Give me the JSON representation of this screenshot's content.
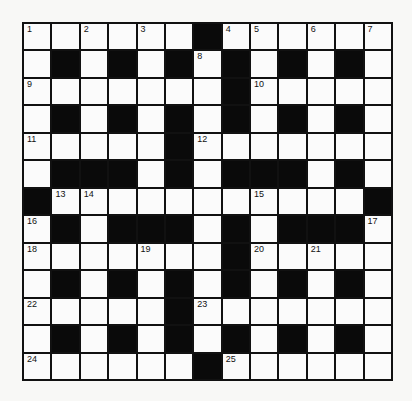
{
  "puzzle": {
    "type": "crossword",
    "size": {
      "rows": 13,
      "cols": 13
    },
    "colors": {
      "black": "#0a0a0a",
      "white": "#fbfbfb",
      "line": "#111111"
    },
    "grid": [
      [
        "1",
        ".",
        "2",
        ".",
        "3",
        ".",
        "#",
        "4",
        "5",
        ".",
        "6",
        ".",
        "7"
      ],
      [
        ".",
        "#",
        ".",
        "#",
        ".",
        "#",
        "8",
        "#",
        ".",
        "#",
        ".",
        "#",
        "."
      ],
      [
        "9",
        ".",
        ".",
        ".",
        ".",
        ".",
        ".",
        "#",
        "10",
        ".",
        ".",
        ".",
        "."
      ],
      [
        ".",
        "#",
        ".",
        "#",
        ".",
        "#",
        ".",
        "#",
        ".",
        "#",
        ".",
        "#",
        "."
      ],
      [
        "11",
        ".",
        ".",
        ".",
        ".",
        "#",
        "12",
        ".",
        ".",
        ".",
        ".",
        ".",
        "."
      ],
      [
        ".",
        "#",
        "#",
        "#",
        ".",
        "#",
        ".",
        "#",
        "#",
        "#",
        ".",
        "#",
        "."
      ],
      [
        "#",
        "13",
        "14",
        ".",
        ".",
        ".",
        ".",
        ".",
        "15",
        ".",
        ".",
        ".",
        "#"
      ],
      [
        "16",
        "#",
        ".",
        "#",
        "#",
        "#",
        ".",
        "#",
        ".",
        "#",
        "#",
        "#",
        "17"
      ],
      [
        "18",
        ".",
        ".",
        ".",
        "19",
        ".",
        ".",
        "#",
        "20",
        ".",
        "21",
        ".",
        "."
      ],
      [
        ".",
        "#",
        ".",
        "#",
        ".",
        "#",
        ".",
        "#",
        ".",
        "#",
        ".",
        "#",
        "."
      ],
      [
        "22",
        ".",
        ".",
        ".",
        ".",
        "#",
        "23",
        ".",
        ".",
        ".",
        ".",
        ".",
        "."
      ],
      [
        ".",
        "#",
        ".",
        "#",
        ".",
        "#",
        ".",
        "#",
        ".",
        "#",
        ".",
        "#",
        "."
      ],
      [
        "24",
        ".",
        ".",
        ".",
        ".",
        ".",
        "#",
        "25",
        ".",
        ".",
        ".",
        ".",
        "."
      ]
    ]
  }
}
